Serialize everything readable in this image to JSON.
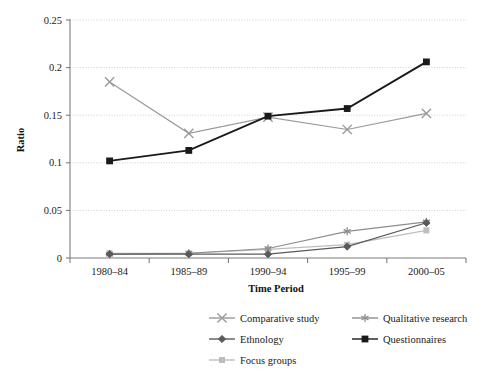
{
  "chart_data": {
    "type": "line",
    "title": "",
    "xlabel": "Time Period",
    "ylabel": "Ratio",
    "categories": [
      "1980–84",
      "1985–89",
      "1990–94",
      "1995–99",
      "2000–05"
    ],
    "ylim": [
      0,
      0.25
    ],
    "yticks": [
      0,
      0.05,
      0.1,
      0.15,
      0.2,
      0.25
    ],
    "ytick_labels": [
      "0",
      "0.05",
      "0.1",
      "0.15",
      "0.2",
      "0.25"
    ],
    "grid": true,
    "grid_axis": "y",
    "legend_position": "bottom",
    "series": [
      {
        "name": "Comparative study",
        "marker": "x",
        "color": "#9a9a9a",
        "values": [
          0.185,
          0.131,
          0.148,
          0.135,
          0.152
        ]
      },
      {
        "name": "Qualitative research",
        "marker": "asterisk",
        "color": "#8e8e8e",
        "values": [
          0.004,
          0.005,
          0.01,
          0.028,
          0.038
        ]
      },
      {
        "name": "Ethnology",
        "marker": "diamond",
        "color": "#5a5a5a",
        "values": [
          0.004,
          0.004,
          0.004,
          0.012,
          0.037
        ]
      },
      {
        "name": "Questionnaires",
        "marker": "square",
        "color": "#1a1a1a",
        "values": [
          0.102,
          0.113,
          0.149,
          0.157,
          0.206
        ]
      },
      {
        "name": "Focus groups",
        "marker": "square-small",
        "color": "#bdbdbd",
        "values": [
          0.005,
          0.005,
          0.009,
          0.014,
          0.029
        ]
      }
    ]
  },
  "legend": {
    "entries": [
      {
        "label": "Comparative study"
      },
      {
        "label": "Qualitative research"
      },
      {
        "label": "Ethnology"
      },
      {
        "label": "Questionnaires"
      },
      {
        "label": "Focus groups"
      }
    ]
  },
  "axes": {
    "y_title": "Ratio",
    "x_title": "Time Period"
  }
}
